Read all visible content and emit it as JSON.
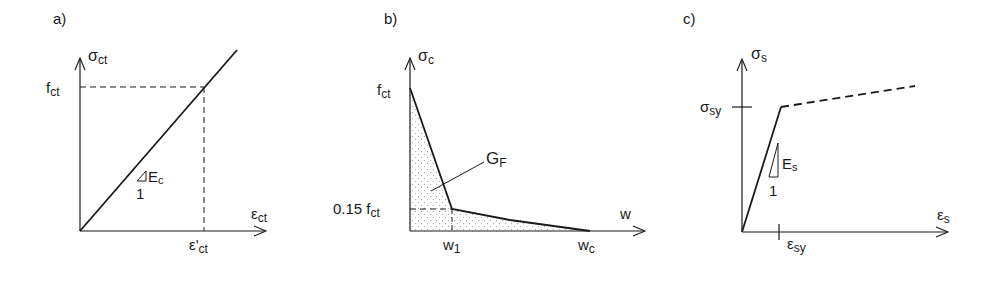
{
  "panels": [
    {
      "id": "a",
      "label": "a)",
      "y_axis_label": "σ",
      "y_axis_sub": "ct",
      "x_axis_label": "ε",
      "x_axis_sub": "ct",
      "y_marker": "f",
      "y_marker_sub": "ct",
      "x_marker": "ε'",
      "x_marker_sub": "ct",
      "slope_label": "E",
      "slope_sub": "c",
      "slope_run": "1",
      "description": "Linear elastic tension law for concrete"
    },
    {
      "id": "b",
      "label": "b)",
      "y_axis_label": "σ",
      "y_axis_sub": "c",
      "x_axis_label": "w",
      "y_marker_top": "f",
      "y_marker_top_sub": "ct",
      "y_marker_knee": "0.15 f",
      "y_marker_knee_sub": "ct",
      "x_marker_knee": "w",
      "x_marker_knee_sub": "1",
      "x_marker_end": "w",
      "x_marker_end_sub": "c",
      "area_label": "G",
      "area_sub": "F",
      "description": "Bilinear tension softening curve; shaded area = fracture energy"
    },
    {
      "id": "c",
      "label": "c)",
      "y_axis_label": "σ",
      "y_axis_sub": "s",
      "x_axis_label": "ε",
      "x_axis_sub": "s",
      "y_marker": "σ",
      "y_marker_sub": "sy",
      "x_marker": "ε",
      "x_marker_sub": "sy",
      "slope_label": "E",
      "slope_sub": "s",
      "slope_run": "1",
      "description": "Bilinear steel law: elastic then hardening (dashed)"
    }
  ],
  "colors": {
    "line": "#1a1a1a",
    "fill_dots": "#9a9a9a",
    "background": "#ffffff"
  }
}
